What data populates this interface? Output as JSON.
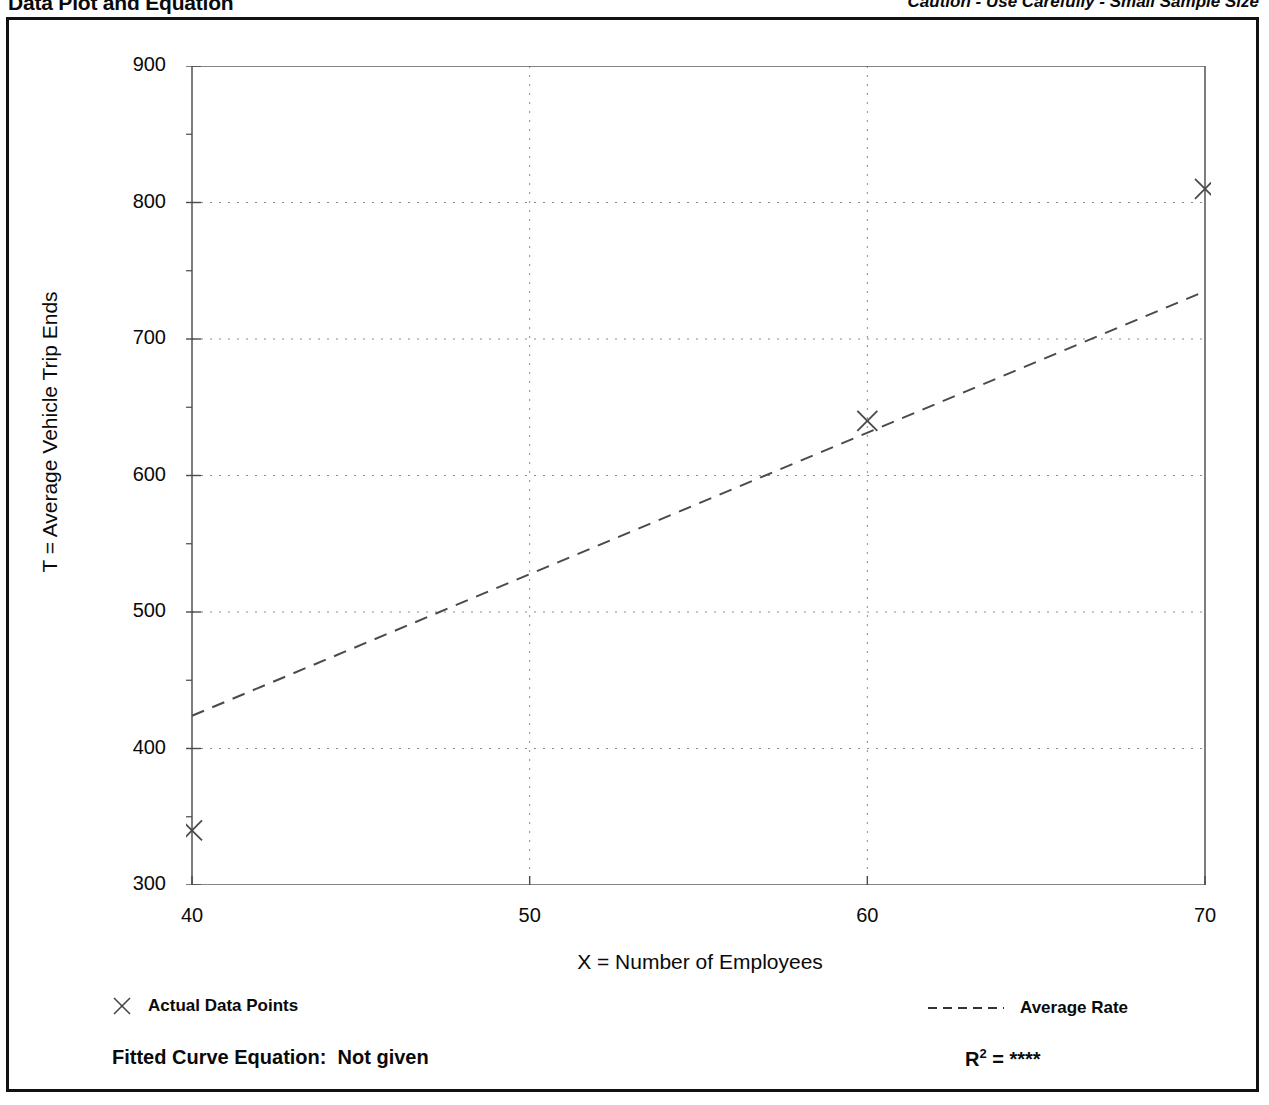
{
  "header": {
    "title": "Data Plot and Equation",
    "caution": "Caution - Use Carefully - Small Sample Size"
  },
  "footer": {
    "equation_label": "Fitted Curve Equation:",
    "equation_value": "Not given",
    "r2_label": "R",
    "r2_exponent": "2",
    "r2_equals": "=",
    "r2_value": "****"
  },
  "legend": {
    "actual_label": "Actual Data Points",
    "actual_marker": "cross-marker-icon",
    "rate_label": "Average Rate",
    "rate_marker": "dashed-line-icon"
  },
  "chart_data": {
    "type": "scatter",
    "title": "Data Plot and Equation",
    "xlabel": "X = Number of Employees",
    "ylabel": "T = Average Vehicle Trip Ends",
    "xlim": [
      40,
      70
    ],
    "ylim": [
      300,
      900
    ],
    "xticks": [
      40,
      50,
      60,
      70
    ],
    "xtick_labels": [
      "40",
      "50",
      "60",
      "70"
    ],
    "x_minor_ticks": [
      45,
      55,
      65
    ],
    "yticks": [
      300,
      400,
      500,
      600,
      700,
      800,
      900
    ],
    "ytick_labels": [
      "300",
      "400",
      "500",
      "600",
      "700",
      "800",
      "900"
    ],
    "y_minor_ticks": [
      350,
      450,
      550,
      650,
      750,
      850
    ],
    "grid": true,
    "grid_style": "dotted",
    "legend_position": "below-axes",
    "series": [
      {
        "name": "Actual Data Points",
        "type": "scatter",
        "marker": "x",
        "points": [
          {
            "x": 40,
            "y": 340
          },
          {
            "x": 60,
            "y": 640
          },
          {
            "x": 70,
            "y": 810
          }
        ]
      },
      {
        "name": "Average Rate",
        "type": "line",
        "style": "dashed",
        "points": [
          {
            "x": 40,
            "y": 424
          },
          {
            "x": 70,
            "y": 735
          }
        ]
      }
    ]
  }
}
